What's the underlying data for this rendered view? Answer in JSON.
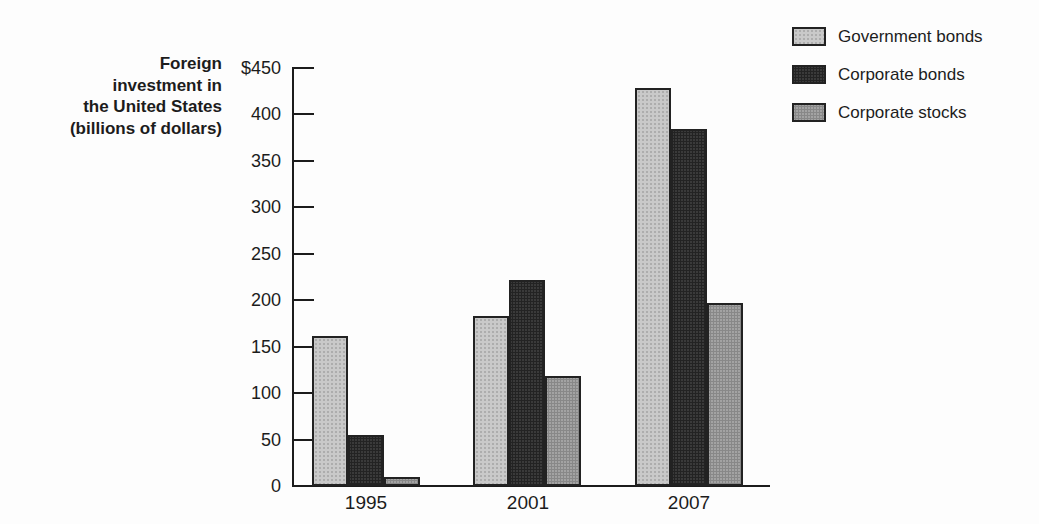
{
  "chart_data": {
    "type": "bar",
    "title": "",
    "ylabel": "Foreign investment in the United States (billions of dollars)",
    "ylabel_lines": [
      "Foreign",
      "investment in",
      "the United States",
      "(billions of dollars)"
    ],
    "unit": "billions of dollars",
    "categories": [
      "1995",
      "2001",
      "2007"
    ],
    "series": [
      {
        "name": "Government bonds",
        "color": "#c9c9c9",
        "values": [
          162,
          183,
          428
        ]
      },
      {
        "name": "Corporate bonds",
        "color": "#3a3a3a",
        "values": [
          55,
          222,
          384
        ]
      },
      {
        "name": "Corporate stocks",
        "color": "#a3a3a3",
        "values": [
          10,
          118,
          197
        ]
      }
    ],
    "ylim": [
      0,
      450
    ],
    "ytick_values": [
      450,
      400,
      350,
      300,
      250,
      200,
      150,
      100,
      50,
      0
    ],
    "ytick_labels": [
      "$450",
      "400",
      "350",
      "300",
      "250",
      "200",
      "150",
      "100",
      "50",
      "0"
    ],
    "grid": false,
    "legend_position": "top-right",
    "axis_color": "#1c1c1c"
  }
}
